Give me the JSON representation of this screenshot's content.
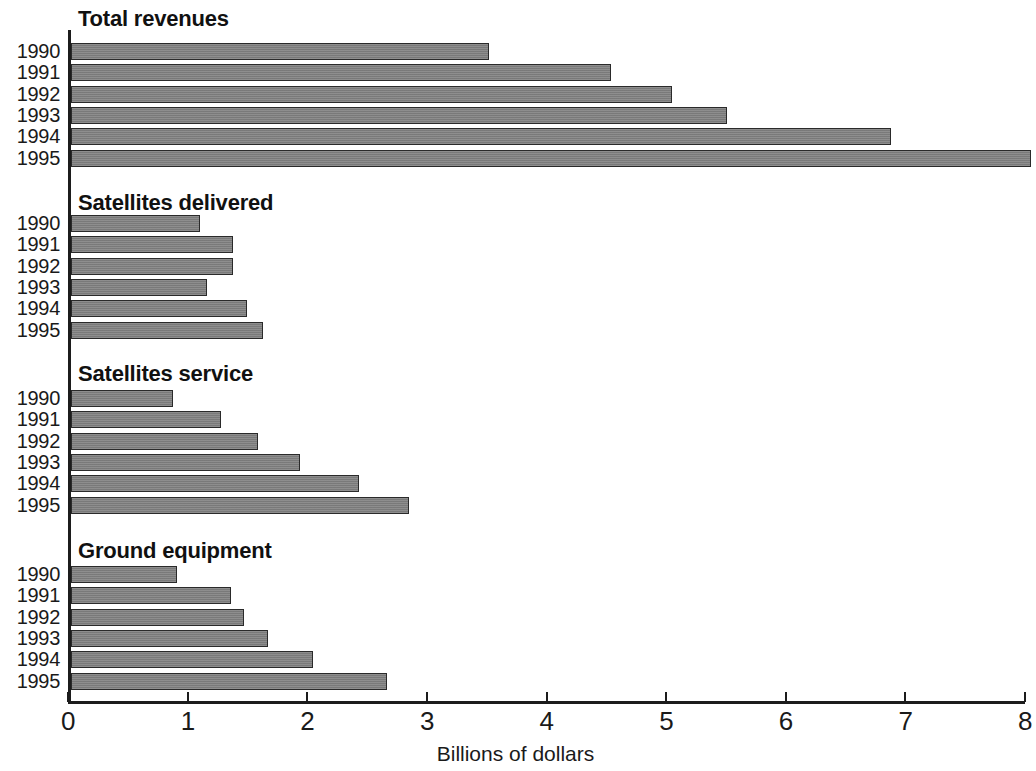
{
  "chart_data": {
    "type": "bar",
    "orientation": "horizontal",
    "title": "",
    "xlabel": "Billions of dollars",
    "ylabel": "",
    "xlim": [
      0,
      8
    ],
    "xticks": [
      0,
      1,
      2,
      3,
      4,
      5,
      6,
      7,
      8
    ],
    "xticklabels": [
      "0",
      "1",
      "2",
      "3",
      "4",
      "5",
      "6",
      "7",
      "8"
    ],
    "grid": false,
    "legend": "none",
    "categories": [
      "1990",
      "1991",
      "1992",
      "1993",
      "1994",
      "1995"
    ],
    "panels": [
      {
        "title": "Total revenues",
        "categories": [
          "1990",
          "1991",
          "1992",
          "1993",
          "1994",
          "1995"
        ],
        "values": [
          3.52,
          4.54,
          5.05,
          5.51,
          6.88,
          8.05
        ]
      },
      {
        "title": "Satellites delivered",
        "categories": [
          "1990",
          "1991",
          "1992",
          "1993",
          "1994",
          "1995"
        ],
        "values": [
          1.1,
          1.38,
          1.38,
          1.16,
          1.5,
          1.63
        ]
      },
      {
        "title": "Satellites service",
        "categories": [
          "1990",
          "1991",
          "1992",
          "1993",
          "1994",
          "1995"
        ],
        "values": [
          0.88,
          1.28,
          1.59,
          1.94,
          2.43,
          2.85
        ]
      },
      {
        "title": "Ground equipment",
        "categories": [
          "1990",
          "1991",
          "1992",
          "1993",
          "1994",
          "1995"
        ],
        "values": [
          0.91,
          1.36,
          1.47,
          1.67,
          2.05,
          2.67
        ]
      }
    ],
    "colors": {
      "bar_fill": "#818181",
      "bar_border": "#2a2a2a",
      "axis": "#1c1c1c",
      "text": "#1a1a1a",
      "background": "#ffffff"
    }
  }
}
